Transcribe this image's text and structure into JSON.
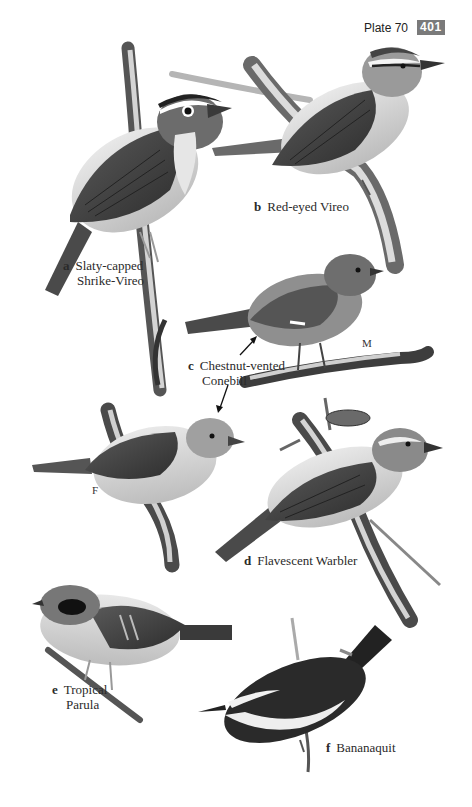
{
  "header": {
    "plate_label": "Plate 70",
    "page_number": "401",
    "badge_color": "#7a7a7a"
  },
  "species": [
    {
      "letter": "a",
      "name_line1": "Slaty-capped",
      "name_line2": "Shrike-Vireo"
    },
    {
      "letter": "b",
      "name_line1": "Red-eyed Vireo"
    },
    {
      "letter": "c",
      "name_line1": "Chestnut-vented",
      "name_line2": "Conebill",
      "sexes": [
        "M",
        "F"
      ]
    },
    {
      "letter": "d",
      "name_line1": "Flavescent Warbler"
    },
    {
      "letter": "e",
      "name_line1": "Tropical",
      "name_line2": "Parula"
    },
    {
      "letter": "f",
      "name_line1": "Bananaquit"
    }
  ]
}
